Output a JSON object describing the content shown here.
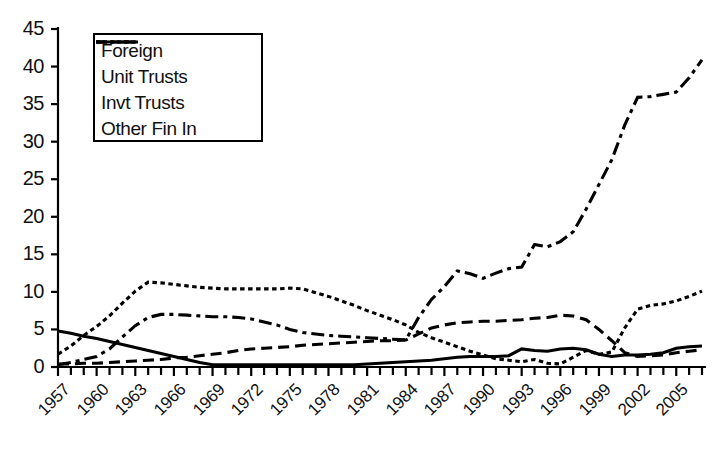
{
  "chart_data": {
    "type": "line",
    "title": "",
    "xlabel": "",
    "ylabel": "",
    "xlim": [
      1957,
      2007
    ],
    "ylim": [
      0,
      45
    ],
    "grid": false,
    "legend_position": "top-left",
    "ytick_labels": [
      "0",
      "5",
      "10",
      "15",
      "20",
      "25",
      "30",
      "35",
      "40",
      "45"
    ],
    "ytick_values": [
      0,
      5,
      10,
      15,
      20,
      25,
      30,
      35,
      40,
      45
    ],
    "xtick_labels": [
      "1957",
      "1960",
      "1963",
      "1966",
      "1969",
      "1972",
      "1975",
      "1978",
      "1981",
      "1984",
      "1987",
      "1990",
      "1993",
      "1996",
      "1999",
      "2002",
      "2005"
    ],
    "xtick_values": [
      1957,
      1960,
      1963,
      1966,
      1969,
      1972,
      1975,
      1978,
      1981,
      1984,
      1987,
      1990,
      1993,
      1996,
      1999,
      2002,
      2005
    ],
    "x": [
      1957,
      1958,
      1959,
      1960,
      1961,
      1962,
      1963,
      1964,
      1965,
      1966,
      1967,
      1968,
      1969,
      1970,
      1971,
      1972,
      1973,
      1974,
      1975,
      1976,
      1977,
      1978,
      1979,
      1980,
      1981,
      1982,
      1983,
      1984,
      1985,
      1986,
      1987,
      1988,
      1989,
      1990,
      1991,
      1992,
      1993,
      1994,
      1995,
      1996,
      1997,
      1998,
      1999,
      2000,
      2001,
      2002,
      2003,
      2004,
      2005,
      2006,
      2007
    ],
    "series": [
      {
        "name": "Foreign",
        "dash": "dash-dot",
        "color": "#000000",
        "values": [
          0.3,
          0.6,
          1.0,
          1.4,
          2.4,
          4.0,
          5.5,
          6.6,
          7.0,
          7.0,
          6.9,
          6.8,
          6.7,
          6.7,
          6.6,
          6.4,
          6.0,
          5.6,
          5.0,
          4.6,
          4.4,
          4.2,
          4.1,
          4.0,
          3.9,
          3.8,
          3.7,
          3.6,
          6.6,
          9.0,
          10.7,
          12.8,
          12.4,
          11.8,
          12.5,
          13.1,
          13.3,
          16.3,
          16.0,
          16.7,
          18.0,
          21.0,
          24.3,
          27.6,
          32.2,
          35.9,
          36.0,
          36.3,
          36.6,
          38.5,
          40.9
        ]
      },
      {
        "name": "Unit Trusts",
        "dash": "dashed",
        "color": "#000000",
        "values": [
          0.4,
          0.4,
          0.5,
          0.5,
          0.6,
          0.7,
          0.8,
          0.9,
          1.0,
          1.2,
          1.3,
          1.5,
          1.7,
          1.9,
          2.2,
          2.4,
          2.5,
          2.6,
          2.7,
          2.9,
          3.0,
          3.1,
          3.2,
          3.3,
          3.4,
          3.5,
          3.5,
          3.6,
          4.4,
          5.2,
          5.6,
          5.9,
          6.0,
          6.1,
          6.1,
          6.2,
          6.3,
          6.5,
          6.6,
          6.9,
          6.8,
          6.3,
          5.0,
          3.5,
          1.9,
          1.4,
          1.5,
          1.6,
          1.9,
          2.1,
          2.3
        ]
      },
      {
        "name": "Invt Trusts",
        "dash": "solid",
        "color": "#000000",
        "values": [
          4.8,
          4.5,
          4.1,
          3.8,
          3.4,
          3.0,
          2.6,
          2.2,
          1.8,
          1.4,
          1.0,
          0.6,
          0.3,
          0.3,
          0.3,
          0.3,
          0.3,
          0.3,
          0.3,
          0.3,
          0.3,
          0.3,
          0.3,
          0.3,
          0.4,
          0.5,
          0.6,
          0.7,
          0.8,
          0.9,
          1.1,
          1.3,
          1.4,
          1.4,
          1.4,
          1.5,
          2.4,
          2.2,
          2.1,
          2.4,
          2.5,
          2.3,
          1.7,
          1.4,
          1.6,
          1.6,
          1.7,
          1.9,
          2.5,
          2.7,
          2.8
        ]
      },
      {
        "name": "Other Fin In",
        "dash": "dotted",
        "color": "#000000",
        "values": [
          1.7,
          2.8,
          4.2,
          5.4,
          6.8,
          8.5,
          10.1,
          11.3,
          11.2,
          11.0,
          10.8,
          10.6,
          10.5,
          10.4,
          10.4,
          10.4,
          10.4,
          10.4,
          10.5,
          10.4,
          9.9,
          9.4,
          8.8,
          8.2,
          7.5,
          6.9,
          6.3,
          5.6,
          4.6,
          3.9,
          3.3,
          2.7,
          2.1,
          1.6,
          1.1,
          0.9,
          0.7,
          1.0,
          0.5,
          0.4,
          1.3,
          2.2,
          1.7,
          2.0,
          5.2,
          7.7,
          8.2,
          8.4,
          8.8,
          9.4,
          10.1
        ]
      }
    ]
  }
}
